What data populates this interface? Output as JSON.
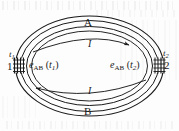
{
  "figure": {
    "kind": "thermocouple-loop-diagram",
    "width": 179,
    "height": 131,
    "background_color": "#fdfdfd",
    "ink_color": "#1a1a1a"
  },
  "conductors": {
    "outer_label": "A",
    "inner_label": "B"
  },
  "current": {
    "top_label": "I",
    "bottom_label": "I",
    "top_arrow_direction": "clockwise-right",
    "bottom_arrow_direction": "clockwise-left"
  },
  "emf": {
    "left": {
      "symbol": "e",
      "subscript": "AB",
      "open_paren": "(",
      "argument": "t",
      "argument_sub": "1",
      "close_paren": ")"
    },
    "right": {
      "symbol": "e",
      "subscript": "AB",
      "open_paren": "(",
      "argument": "t",
      "argument_sub": "2",
      "close_paren": ")"
    }
  },
  "junctions": {
    "left": {
      "temperature_symbol": "t",
      "temperature_sub": "1",
      "node_number": "1"
    },
    "right": {
      "temperature_symbol": "t",
      "temperature_sub": "2",
      "node_number": "2"
    }
  }
}
